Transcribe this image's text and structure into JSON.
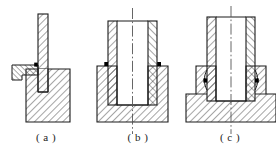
{
  "figure": {
    "kind": "engineering-cross-section-drawing",
    "panel_count": 3,
    "line_color": "#1a1a1a",
    "hatch_color": "#2b2b2b",
    "marker_color": "#000000",
    "background_color": "#ffffff",
    "centerline_color": "#555555"
  },
  "captions": [
    {
      "id": "a",
      "label": "( a )"
    },
    {
      "id": "b",
      "label": "( b )"
    },
    {
      "id": "c",
      "label": "( c )"
    }
  ],
  "panels": [
    {
      "id": "a",
      "name": "panel-a",
      "description": "Thin vertical rod seated in a solid block with a side hook bracket",
      "features": [
        "vertical-rod",
        "solid-base-block",
        "left-hook-bracket",
        "contact-marker"
      ],
      "marker_count": 1
    },
    {
      "id": "b",
      "name": "panel-b",
      "description": "Tube with bore seated inside a cup shaped base, centerline through bore",
      "features": [
        "hollow-tube",
        "cup-base",
        "vertical-centerline",
        "contact-marker-left",
        "contact-marker-right"
      ],
      "marker_count": 2
    },
    {
      "id": "c",
      "name": "panel-c",
      "description": "Tube seated in a wide stepped flange base with curved seal seats",
      "features": [
        "hollow-tube",
        "stepped-flange-base",
        "vertical-centerline",
        "seal-seat-left",
        "seal-seat-right",
        "contact-marker-left",
        "contact-marker-right"
      ],
      "marker_count": 2
    }
  ]
}
